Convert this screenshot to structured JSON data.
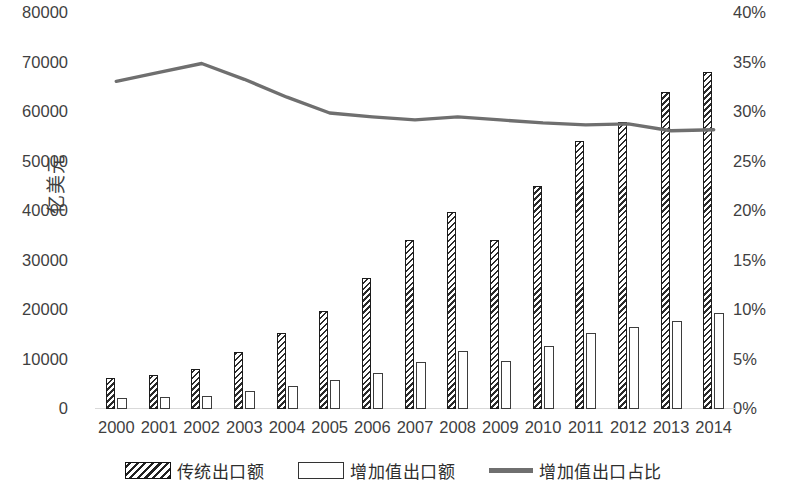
{
  "chart_data": {
    "type": "bar",
    "title": "",
    "subtitle": "",
    "xlabel": "",
    "ylabel": "亿美元",
    "y2label": "",
    "grid": false,
    "legend_position": "bottom",
    "categories": [
      "2000",
      "2001",
      "2002",
      "2003",
      "2004",
      "2005",
      "2006",
      "2007",
      "2008",
      "2009",
      "2010",
      "2011",
      "2012",
      "2013",
      "2014"
    ],
    "y_ticks": [
      "0",
      "10000",
      "20000",
      "30000",
      "40000",
      "50000",
      "60000",
      "70000",
      "80000"
    ],
    "y_tick_values": [
      0,
      10000,
      20000,
      30000,
      40000,
      50000,
      60000,
      70000,
      80000
    ],
    "ylim": [
      0,
      80000
    ],
    "y2_ticks": [
      "0%",
      "5%",
      "10%",
      "15%",
      "20%",
      "25%",
      "30%",
      "35%",
      "40%"
    ],
    "y2_tick_values": [
      0,
      5,
      10,
      15,
      20,
      25,
      30,
      35,
      40
    ],
    "y2lim": [
      0,
      40
    ],
    "series": [
      {
        "name": "传统出口额",
        "type": "bar",
        "axis": "left",
        "style": "hatched",
        "values": [
          6200,
          6800,
          8000,
          11600,
          15300,
          19800,
          26400,
          34200,
          39900,
          34200,
          45000,
          54200,
          58000,
          64000,
          68000
        ]
      },
      {
        "name": "增加值出口额",
        "type": "bar",
        "axis": "left",
        "style": "hollow",
        "values": [
          2300,
          2400,
          2600,
          3700,
          4600,
          5800,
          7200,
          9400,
          11700,
          9800,
          12700,
          15300,
          16600,
          17700,
          19300
        ]
      },
      {
        "name": "增加值出口占比",
        "type": "line",
        "axis": "right",
        "unit": "%",
        "color": "#6f6f6f",
        "values": [
          33.1,
          34.0,
          34.9,
          33.3,
          31.5,
          29.9,
          29.5,
          29.2,
          29.5,
          29.2,
          28.9,
          28.7,
          28.8,
          28.1,
          28.2
        ]
      }
    ]
  },
  "legend": {
    "items": [
      {
        "label": "传统出口额",
        "swatch": "hatched-bar-swatch"
      },
      {
        "label": "增加值出口额",
        "swatch": "hollow-bar-swatch"
      },
      {
        "label": "增加值出口占比",
        "swatch": "line-swatch"
      }
    ]
  },
  "colors": {
    "hatch_bar": "#2b2b2b",
    "hollow_bar": "#3d3d3d",
    "line": "#6f6f6f",
    "text": "#3f3f3f",
    "background": "#ffffff"
  }
}
